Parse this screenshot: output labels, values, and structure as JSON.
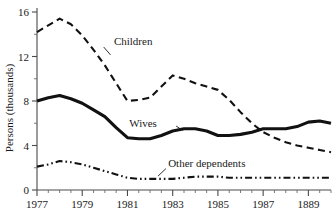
{
  "chart_data": {
    "type": "line",
    "title": "",
    "subtitle": "",
    "xlabel": "",
    "ylabel": "Persons (thousands)",
    "xlim": [
      1977,
      1990
    ],
    "ylim": [
      0,
      16
    ],
    "grid": false,
    "legend_position": "inline-annotations",
    "x_tick_labels": [
      "1977",
      "1979",
      "1981",
      "1983",
      "1985",
      "1987",
      "1889"
    ],
    "x_tick_values": [
      1977,
      1979,
      1981,
      1983,
      1985,
      1987,
      1989
    ],
    "x_minor_tick_interval": 0.5,
    "y_tick_labels": [
      "0",
      "4",
      "8",
      "12",
      "16"
    ],
    "y_tick_values": [
      0,
      4,
      8,
      12,
      16
    ],
    "y_minor_tick_values": [
      2,
      6,
      10,
      14
    ],
    "x": [
      1977,
      1977.5,
      1978,
      1978.5,
      1979,
      1979.5,
      1980,
      1980.5,
      1981,
      1981.5,
      1982,
      1982.5,
      1983,
      1983.5,
      1984,
      1984.5,
      1985,
      1985.5,
      1986,
      1986.5,
      1987,
      1987.5,
      1988,
      1988.5,
      1989,
      1989.5,
      1990
    ],
    "series": [
      {
        "name": "Children",
        "style": "dashed",
        "color": "#111111",
        "width": 2.1,
        "values": [
          14.2,
          14.8,
          15.4,
          14.9,
          13.9,
          12.6,
          11.2,
          9.6,
          8.0,
          8.1,
          8.3,
          9.3,
          10.3,
          10.0,
          9.6,
          9.3,
          9.0,
          8.1,
          7.0,
          6.0,
          5.2,
          4.7,
          4.3,
          4.0,
          3.8,
          3.6,
          3.4
        ]
      },
      {
        "name": "Wives",
        "style": "solid",
        "color": "#111111",
        "width": 3.1,
        "values": [
          8.0,
          8.3,
          8.5,
          8.2,
          7.8,
          7.2,
          6.6,
          5.6,
          4.7,
          4.6,
          4.6,
          4.9,
          5.3,
          5.5,
          5.5,
          5.3,
          4.9,
          4.9,
          5.0,
          5.2,
          5.5,
          5.5,
          5.5,
          5.7,
          6.1,
          6.2,
          6.0
        ]
      },
      {
        "name": "Other dependents",
        "style": "dash-dot-dot",
        "color": "#111111",
        "width": 2.1,
        "values": [
          2.1,
          2.3,
          2.6,
          2.5,
          2.3,
          2.0,
          1.7,
          1.4,
          1.1,
          1.0,
          1.0,
          1.0,
          1.0,
          1.1,
          1.2,
          1.2,
          1.2,
          1.1,
          1.1,
          1.1,
          1.1,
          1.1,
          1.1,
          1.1,
          1.1,
          1.1,
          1.1
        ]
      }
    ],
    "annotations": [
      {
        "text": "Children",
        "x": 1980.4,
        "y": 13.0
      },
      {
        "text": "Wives",
        "x": 1982.3,
        "y": 5.7
      },
      {
        "text": "Other dependents",
        "x": 1982.8,
        "y": 2.1
      }
    ]
  }
}
